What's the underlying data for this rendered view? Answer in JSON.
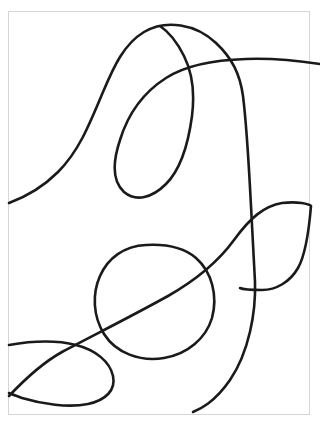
{
  "artwork": {
    "title": "Abstract Continuous Line Drawing",
    "medium": "ink line drawing",
    "canvas": {
      "width": 320,
      "height": 429,
      "background_color": "#ffffff"
    },
    "frame": {
      "name": "paper-border",
      "x": 8,
      "y": 11,
      "width": 302,
      "height": 404,
      "border_color": "#d6d6d8",
      "border_width": 1
    },
    "stroke_style": {
      "color": "#1a1a1a",
      "width": 2.6,
      "cap": "round",
      "join": "round"
    },
    "strokes": [
      {
        "name": "upper-sweep-stroke",
        "description": "Long curve entering at the left edge, rising into a broad hump across the top, then descending steeply down the right side to the lower frame.",
        "d": "M 9 203 C 28 196 44 186 58 172 C 78 152 88 128 103 92 C 114 66 124 44 144 32 C 166 19 196 24 216 43 C 232 58 240 74 243 96 C 247 128 249 168 251 206 C 253 242 254 262 255 282 C 256 312 249 352 230 380 C 214 403 200 409 193 412"
      },
      {
        "name": "upper-teardrop-loop-stroke",
        "description": "Closed teardrop loop in the upper middle, its tail running out to the right edge crossing the upper sweep.",
        "d": "M 320 64 C 300 61 274 58 246 59 C 214 60 186 65 166 78 C 144 92 128 114 120 140 C 112 164 113 182 124 192 C 136 202 152 198 166 184 C 180 170 188 146 192 116 C 195 92 192 72 184 56 C 176 40 166 30 160 26"
      },
      {
        "name": "center-oval-loop-stroke",
        "description": "Closed oval loop in the centre-lower area.",
        "d": "M 146 245 C 124 246 108 258 100 276 C 92 294 93 316 104 334 C 116 353 140 362 164 358 C 188 354 206 338 212 318 C 218 296 212 272 196 258 C 182 246 164 244 146 245 Z"
      },
      {
        "name": "lower-left-loop-stroke",
        "description": "Open loop entering and leaving the left edge near the bottom, bulging to the right.",
        "d": "M 9 345 C 32 341 56 340 76 345 C 96 350 110 362 113 376 C 116 390 106 400 88 404 C 68 408 42 404 22 398 C 14 395 11 394 9 393"
      },
      {
        "name": "diagonal-to-right-loop-stroke",
        "description": "Long diagonal rising from the lower left through the centre to the upper right, then curling into a partial loop that meets the right edge.",
        "d": "M 9 396 C 26 378 44 362 62 352 C 92 336 132 316 168 296 C 196 280 218 262 234 240 C 250 218 264 206 282 203 C 298 201 309 204 311 206 C 309 230 306 254 298 268 C 290 282 276 290 262 290 C 248 290 242 289 240 288"
      }
    ]
  }
}
